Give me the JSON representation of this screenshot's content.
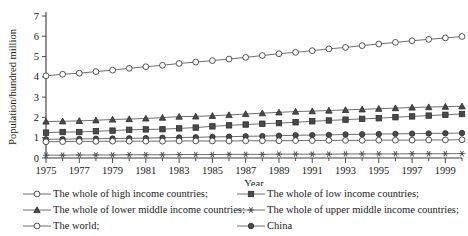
{
  "chart_data": {
    "type": "line",
    "title": "",
    "xlabel": "Year",
    "ylabel": "Population/hundred million",
    "xlim": [
      1975,
      2000
    ],
    "ylim": [
      0,
      7
    ],
    "yticks": [
      0,
      1,
      2,
      3,
      4,
      5,
      6,
      7
    ],
    "xtick_labels": [
      "1975",
      "1977",
      "1979",
      "1981",
      "1983",
      "1985",
      "1987",
      "1989",
      "1991",
      "1993",
      "1995",
      "1997",
      "1999"
    ],
    "xticks": [
      1975,
      1977,
      1979,
      1981,
      1983,
      1985,
      1987,
      1989,
      1991,
      1993,
      1995,
      1997,
      1999
    ],
    "grid": false,
    "legend_position": "below",
    "x": [
      1975,
      1976,
      1977,
      1978,
      1979,
      1980,
      1981,
      1982,
      1983,
      1984,
      1985,
      1986,
      1987,
      1988,
      1989,
      1990,
      1991,
      1992,
      1993,
      1994,
      1995,
      1996,
      1997,
      1998,
      1999,
      2000
    ],
    "series": [
      {
        "name": "The world;",
        "marker": "open-circle",
        "values": [
          4.05,
          4.13,
          4.18,
          4.26,
          4.33,
          4.42,
          4.5,
          4.57,
          4.66,
          4.73,
          4.8,
          4.88,
          4.96,
          5.05,
          5.14,
          5.21,
          5.29,
          5.38,
          5.45,
          5.54,
          5.62,
          5.7,
          5.78,
          5.85,
          5.92,
          5.99
        ]
      },
      {
        "name": "The whole of lower middle income countries;",
        "marker": "solid-triangle",
        "values": [
          1.8,
          1.81,
          1.83,
          1.86,
          1.9,
          1.92,
          1.95,
          1.99,
          2.04,
          2.05,
          2.08,
          2.12,
          2.17,
          2.21,
          2.25,
          2.29,
          2.31,
          2.34,
          2.37,
          2.4,
          2.43,
          2.46,
          2.49,
          2.51,
          2.53,
          2.55
        ]
      },
      {
        "name": "The whole of low income countries;",
        "marker": "solid-square",
        "values": [
          1.25,
          1.28,
          1.28,
          1.32,
          1.35,
          1.39,
          1.41,
          1.42,
          1.46,
          1.5,
          1.56,
          1.61,
          1.65,
          1.69,
          1.72,
          1.76,
          1.81,
          1.85,
          1.89,
          1.93,
          1.96,
          2.01,
          2.05,
          2.09,
          2.13,
          2.17
        ]
      },
      {
        "name": "China",
        "marker": "solid-circle",
        "values": [
          0.92,
          0.93,
          0.94,
          0.95,
          0.96,
          0.97,
          0.98,
          1.0,
          1.01,
          1.02,
          1.04,
          1.05,
          1.07,
          1.08,
          1.1,
          1.12,
          1.13,
          1.14,
          1.16,
          1.17,
          1.18,
          1.19,
          1.2,
          1.21,
          1.22,
          1.23
        ]
      },
      {
        "name": "The whole of high income countries;",
        "marker": "open-circle",
        "values": [
          0.8,
          0.81,
          0.82,
          0.82,
          0.83,
          0.83,
          0.83,
          0.83,
          0.84,
          0.84,
          0.84,
          0.84,
          0.85,
          0.85,
          0.85,
          0.86,
          0.86,
          0.87,
          0.87,
          0.87,
          0.88,
          0.88,
          0.88,
          0.89,
          0.89,
          0.9
        ]
      },
      {
        "name": "The whole of upper middle income countries;",
        "marker": "asterisk",
        "values": [
          0.14,
          0.14,
          0.15,
          0.15,
          0.15,
          0.16,
          0.16,
          0.16,
          0.17,
          0.17,
          0.17,
          0.18,
          0.18,
          0.18,
          0.19,
          0.19,
          0.19,
          0.19,
          0.2,
          0.2,
          0.2,
          0.2,
          0.21,
          0.21,
          0.21,
          0.22
        ]
      }
    ]
  },
  "legend": {
    "rows": [
      {
        "left": {
          "label": "The whole of high income countries;",
          "marker": "open-circle"
        },
        "right": {
          "label": "The whole of low income countries;",
          "marker": "solid-square"
        }
      },
      {
        "left": {
          "label": "The whole of lower middle income countries;",
          "marker": "solid-triangle"
        },
        "right": {
          "label": "The whole of upper middle income countries;",
          "marker": "asterisk"
        }
      },
      {
        "left": {
          "label": "The world;",
          "marker": "open-circle"
        },
        "right": {
          "label": "China",
          "marker": "solid-circle"
        }
      }
    ]
  },
  "colors": {
    "line": "#555555",
    "marker_fill": "#4a4a4a",
    "marker_stroke": "#2b2b2b",
    "axis": "#3a3a3a",
    "text": "#1a1a1a",
    "background": "#ffffff"
  }
}
